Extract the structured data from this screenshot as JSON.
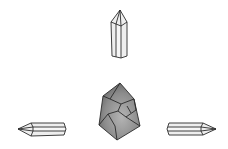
{
  "diagram": {
    "background": "#ffffff",
    "line_color": "#2a2a2a",
    "elements": [
      {
        "id": "top-crystal",
        "kind": "hexagonal prism crystal",
        "orientation": "pointing up",
        "fill": "#eeeeee"
      },
      {
        "id": "center-crystal",
        "kind": "irregular polyhedron",
        "orientation": "center",
        "fill": "#8a8a8a"
      },
      {
        "id": "left-crystal",
        "kind": "hexagonal prism crystal",
        "orientation": "pointing left",
        "fill": "#eeeeee"
      },
      {
        "id": "right-crystal",
        "kind": "hexagonal prism crystal",
        "orientation": "pointing right",
        "fill": "#eeeeee"
      }
    ]
  }
}
